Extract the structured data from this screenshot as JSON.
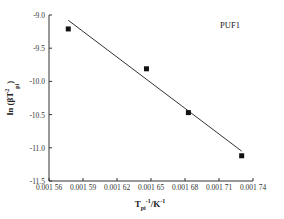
{
  "chart_data": {
    "type": "scatter",
    "title": "",
    "annotation": "PUF1",
    "xlabel": "T_pi^-1/K^-1",
    "ylabel": "ln (β/T_pi^2)",
    "xlim": [
      0.00156,
      0.00174
    ],
    "ylim": [
      -11.5,
      -9.0
    ],
    "x_ticks": [
      "0.001 56",
      "0.001 59",
      "0.001 62",
      "0.001 65",
      "0.001 68",
      "0.001 71",
      "0.001 74"
    ],
    "y_ticks": [
      "-9.0",
      "-9.5",
      "-10.0",
      "-10.5",
      "-11.0",
      "-11.5"
    ],
    "grid": false,
    "series": [
      {
        "name": "PUF1 data",
        "marker": "square",
        "x": [
          0.001577,
          0.001646,
          0.001683,
          0.00173
        ],
        "y": [
          -9.21,
          -9.81,
          -10.47,
          -11.12
        ]
      },
      {
        "name": "linear fit",
        "type": "line",
        "x": [
          0.001577,
          0.00173
        ],
        "y": [
          -9.08,
          -11.05
        ]
      }
    ]
  },
  "labels": {
    "annotation": "PUF1",
    "xlabel_main": "T",
    "xlabel_sub": "pi",
    "xlabel_sup": "-1",
    "xlabel_rest": "/K",
    "xlabel_sup2": "-1",
    "ylabel": "ln (βT",
    "ylabel_sup": "2",
    "ylabel_sub": "pi",
    "ylabel_close": ")"
  }
}
